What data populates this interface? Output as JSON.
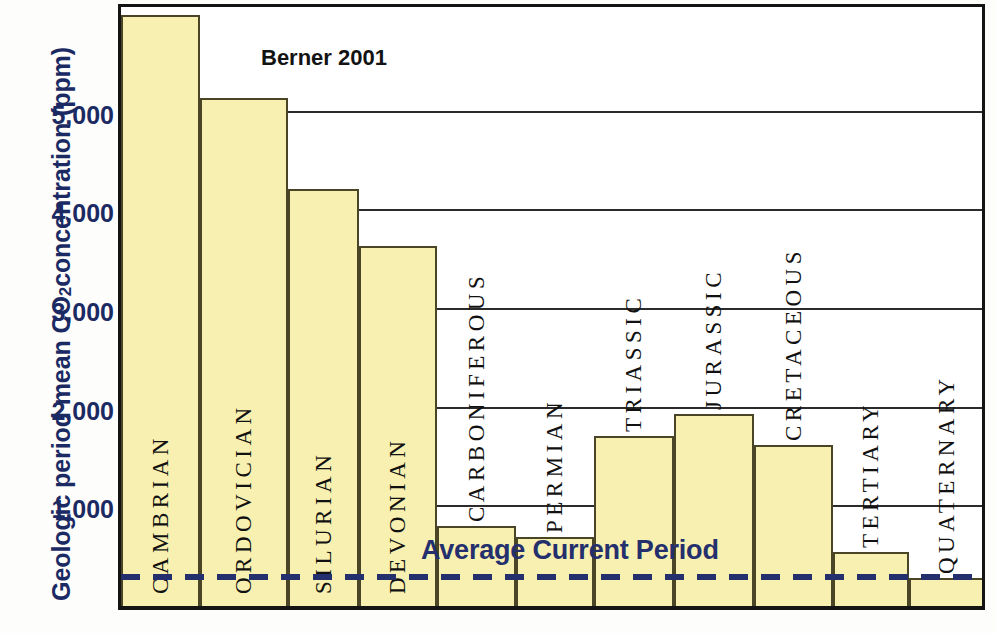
{
  "chart_data": {
    "type": "bar",
    "title": "",
    "annotation": "Berner 2001",
    "xlabel": "",
    "ylabel_parts": {
      "pre": "Geologic period mean CO",
      "sub": "2",
      "post": " concentration (ppm)"
    },
    "ylabel": "Geologic period mean CO2 concentration (ppm)",
    "ylim": [
      0,
      6100
    ],
    "yticks": [
      1000,
      2000,
      3000,
      4000,
      5000
    ],
    "ytick_labels": [
      "1,000",
      "2,000",
      "3,000",
      "4,000",
      "5,000"
    ],
    "grid": true,
    "legend": "none",
    "bar_color": "#f7f0b0",
    "bar_edge_color": "#4a4526",
    "accent_color": "#1b2a63",
    "categories": [
      "CAMBRIAN",
      "ORDOVICIAN",
      "SILURIAN",
      "DEVONIAN",
      "CARBONIFEROUS",
      "PERMIAN",
      "TRIASSIC",
      "JURASSIC",
      "CRETACEOUS",
      "TERTIARY",
      "QUATERNARY"
    ],
    "values": [
      5990,
      5150,
      4230,
      3650,
      810,
      700,
      1720,
      1950,
      1630,
      550,
      280
    ],
    "reference_line": {
      "label": "Average Current Period",
      "value": 280,
      "style": "dashed",
      "color": "#242f6e"
    }
  }
}
